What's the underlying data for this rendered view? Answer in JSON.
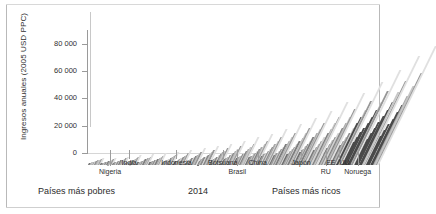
{
  "chart_data": {
    "type": "bar",
    "title": "",
    "subtitle": "",
    "ylabel": "Ingresos anuales (2005 USD PPC)",
    "xlabel": "",
    "year_label": "2014",
    "ylim": [
      0,
      90000
    ],
    "yticks": [
      0,
      20000,
      40000,
      60000,
      80000
    ],
    "ytick_labels": [
      "0",
      "20 000",
      "40 000",
      "60 000",
      "80 000"
    ],
    "grid": false,
    "legend": "none",
    "x_axis_description": "Población mundial ordenada de países más pobres a países más ricos",
    "left_caption": "Países más pobres",
    "right_caption": "Países más ricos",
    "country_markers": [
      {
        "label": "Nigeria",
        "x_pct": 7.6,
        "row": 1
      },
      {
        "label": "India",
        "x_pct": 14.2,
        "row": 0
      },
      {
        "label": "Indonesia",
        "x_pct": 30.5,
        "row": 0
      },
      {
        "label": "Botsuana",
        "x_pct": 46.5,
        "row": 0
      },
      {
        "label": "Brasil",
        "x_pct": 51.5,
        "row": 1
      },
      {
        "label": "China",
        "x_pct": 58.5,
        "row": 0
      },
      {
        "label": "Japón",
        "x_pct": 73.5,
        "row": 0
      },
      {
        "label": "RU",
        "x_pct": 82.0,
        "row": 1
      },
      {
        "label": "EE. UU.",
        "x_pct": 86.5,
        "row": 0
      },
      {
        "label": "Noruega",
        "x_pct": 93.0,
        "row": 1
      }
    ],
    "series": [
      {
        "name": "Ingreso anual por decil de país (2005 USD PPC)",
        "values": [
          1400,
          1800,
          2100,
          2400,
          2700,
          3000,
          3400,
          3800,
          4300,
          5200,
          1200,
          1600,
          1900,
          2200,
          2500,
          2900,
          3300,
          3700,
          4200,
          5400,
          1500,
          1900,
          2300,
          2600,
          3000,
          3400,
          3900,
          4400,
          5000,
          6200,
          1700,
          2100,
          2500,
          2900,
          3300,
          3800,
          4300,
          4900,
          5600,
          7000,
          1900,
          2400,
          2800,
          3200,
          3700,
          4200,
          4800,
          5400,
          6200,
          7800,
          2100,
          2600,
          3100,
          3500,
          4000,
          4600,
          5200,
          5900,
          6800,
          8600,
          2300,
          2900,
          3400,
          3900,
          4500,
          5100,
          5800,
          6600,
          7600,
          9600,
          2600,
          3200,
          3800,
          4400,
          5000,
          5700,
          6500,
          7400,
          8500,
          10800,
          2900,
          3600,
          4300,
          4900,
          5600,
          6400,
          7300,
          8300,
          9600,
          12200,
          3300,
          4100,
          4800,
          5500,
          6300,
          7200,
          8200,
          9400,
          10800,
          13800,
          3700,
          4600,
          5400,
          6200,
          7100,
          8100,
          9200,
          10600,
          12200,
          15600,
          4200,
          5200,
          6100,
          7000,
          8000,
          9100,
          10400,
          12000,
          13800,
          17800,
          4800,
          5900,
          6900,
          7900,
          9000,
          10300,
          11800,
          13500,
          15600,
          20200,
          5500,
          6700,
          7900,
          9000,
          10300,
          11700,
          13400,
          15400,
          17800,
          23000,
          6300,
          7700,
          9000,
          10300,
          11700,
          13400,
          15300,
          17600,
          20400,
          26400,
          7200,
          8800,
          10300,
          11800,
          13400,
          15300,
          17500,
          20200,
          23400,
          30200,
          8300,
          10100,
          11800,
          13500,
          15400,
          17600,
          20100,
          23100,
          26800,
          34600,
          9600,
          11600,
          13600,
          15500,
          17700,
          20200,
          23100,
          26600,
          30800,
          39800,
          11000,
          13400,
          15600,
          17900,
          20400,
          23300,
          26600,
          30600,
          35400,
          45800,
          12700,
          15400,
          18000,
          20600,
          23500,
          26800,
          30600,
          35200,
          40800,
          52800,
          14600,
          17700,
          20700,
          23700,
          27000,
          30800,
          35200,
          40400,
          46800,
          60600,
          16800,
          20300,
          23800,
          27200,
          31000,
          35400,
          40400,
          46400,
          53800,
          69600,
          19300,
          23400,
          27300,
          31200,
          35600,
          40600,
          46400,
          53200,
          61600,
          79800,
          21000,
          25400,
          29700,
          33900,
          38700,
          44100,
          50400,
          57800,
          67000,
          86800
        ]
      }
    ]
  }
}
